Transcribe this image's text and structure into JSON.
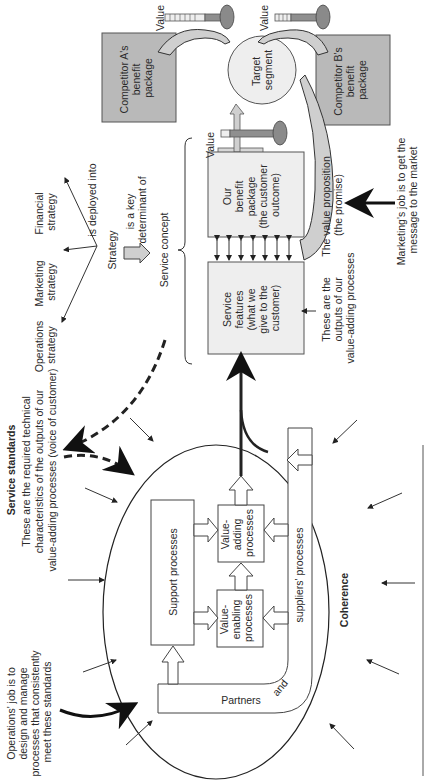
{
  "diagram": {
    "strategy": {
      "financial": [
        "Financial",
        "strategy"
      ],
      "marketing": [
        "Marketing",
        "strategy"
      ],
      "operations": [
        "Operations",
        "strategy"
      ],
      "center": "Strategy",
      "deployed_label": "is deployed into",
      "determinant_label": [
        "is a key",
        "determinant of"
      ],
      "service_concept": "Service concept"
    },
    "competitors": {
      "a": [
        "Competitor A's",
        "benefit",
        "package"
      ],
      "b": [
        "Competitor B's",
        "benefit",
        "package"
      ]
    },
    "value_labels": [
      "Value",
      "Value",
      "Value"
    ],
    "target_segment": [
      "Target",
      "segment"
    ],
    "our_benefit": [
      "Our",
      "benefit",
      "package",
      "(the customer",
      "outcome)"
    ],
    "service_features": [
      "Service",
      "features",
      "(what we",
      "give to the",
      "customer)"
    ],
    "outputs_note": [
      "These are the",
      "outputs of our",
      "value-adding processes"
    ],
    "value_proposition": [
      "The value proposition",
      "(the promise)"
    ],
    "marketing_job": [
      "Marketing's job is to get the",
      "message to the market"
    ],
    "service_standards": {
      "title": "Service standards",
      "lines": [
        "These are the required technical",
        "characteristics of the outputs of our",
        "value-adding processes (voice of customer)"
      ]
    },
    "operations_job": [
      "Operations' job is to",
      "design and manage",
      "processes that consistently",
      "meet these standards"
    ],
    "processes": {
      "support": "Support processes",
      "value_adding": [
        "Value-",
        "adding",
        "processes"
      ],
      "value_enabling": [
        "Value-",
        "enabling",
        "processes"
      ],
      "partners": "Partners",
      "and": "and",
      "suppliers": "suppliers' processes"
    },
    "coherence": "Coherence"
  }
}
